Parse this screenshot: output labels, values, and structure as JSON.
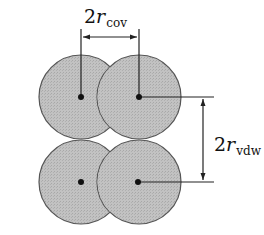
{
  "diagram": {
    "type": "molecular-packing",
    "colors": {
      "atom_fill": "#bdbdbd",
      "atom_stroke": "#555555",
      "line": "#222222",
      "nucleus": "#111111"
    },
    "molecules": [
      {
        "name": "top-molecule",
        "atoms": [
          {
            "cx": 81,
            "cy": 97,
            "r": 42
          },
          {
            "cx": 139,
            "cy": 97,
            "r": 42
          }
        ]
      },
      {
        "name": "bottom-molecule",
        "atoms": [
          {
            "cx": 81,
            "cy": 182,
            "r": 42
          },
          {
            "cx": 139,
            "cy": 182,
            "r": 42
          }
        ]
      }
    ],
    "dimensions": {
      "covalent": {
        "coefficient": "2",
        "symbol": "r",
        "subscript": "cov",
        "meaning": "covalent bond length (twice covalent radius)"
      },
      "van_der_waals": {
        "coefficient": "2",
        "symbol": "r",
        "subscript": "vdw",
        "meaning": "intermolecular distance (twice van der Waals radius)"
      }
    }
  }
}
